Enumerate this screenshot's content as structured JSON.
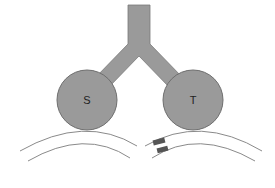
{
  "diagram": {
    "nodes": [
      {
        "id": "S",
        "label": "S"
      },
      {
        "id": "T",
        "label": "T"
      }
    ],
    "connector": {
      "description": "Y-shaped tube joining S and T to a vertical stem"
    },
    "markers": {
      "description": "two small dark rectangles on right arc pair"
    },
    "colors": {
      "fill": "#9a9a9a",
      "stroke": "#6e6e6e",
      "arc": "#8a8a8a",
      "marker": "#555555",
      "label": "#222222"
    }
  }
}
